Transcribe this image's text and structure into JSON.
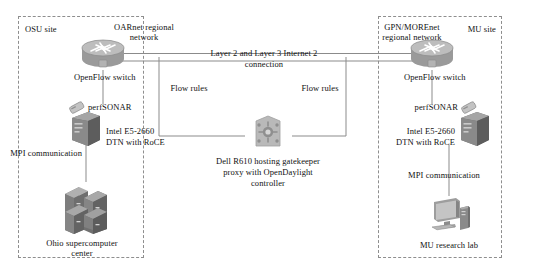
{
  "diagram": {
    "background_color": "#ffffff",
    "line_color": "#8b8b8b",
    "text_color": "#111111",
    "dash_color": "#8e8e8e"
  },
  "sites": {
    "left": {
      "box_label": "OSU site",
      "network_label": "OARnet regional\nnetwork",
      "network_label_line1": "OARnet regional",
      "network_label_line2": "network",
      "switch_label": "OpenFlow switch",
      "perfsonar_label": "perfSONAR",
      "dtn_label_line1": "Intel E5-2660",
      "dtn_label_line2": "DTN with RoCE",
      "mpi_label": "MPI communication",
      "endpoint_label_line1": "Ohio supercomputer",
      "endpoint_label_line2": "center",
      "flow_rules_label": "Flow rules"
    },
    "right": {
      "box_label": "MU site",
      "network_label_line1": "GPN/MOREnet",
      "network_label_line2": "regional network",
      "switch_label": "OpenFlow switch",
      "perfsonar_label": "perfSONAR",
      "dtn_label_line1": "Intel E5-2660",
      "dtn_label_line2": "DTN with RoCE",
      "mpi_label": "MPI communication",
      "endpoint_label": "MU research lab",
      "flow_rules_label": "Flow rules"
    }
  },
  "links": {
    "backbone_line1": "Layer 2 and Layer 3 Internet 2",
    "backbone_line2": "connection"
  },
  "controller": {
    "label_line1": "Dell R610 hosting gatekeeper",
    "label_line2": "proxy with OpenDaylight",
    "label_line3": "controller"
  },
  "icons": {
    "router": "router-icon",
    "server_tower": "server-tower-icon",
    "perfsonar_device": "perfsonar-device-icon",
    "supercomputer": "supercomputer-rack-icon",
    "workstation": "desktop-computer-icon",
    "gatekeeper": "gatekeeper-server-icon"
  }
}
